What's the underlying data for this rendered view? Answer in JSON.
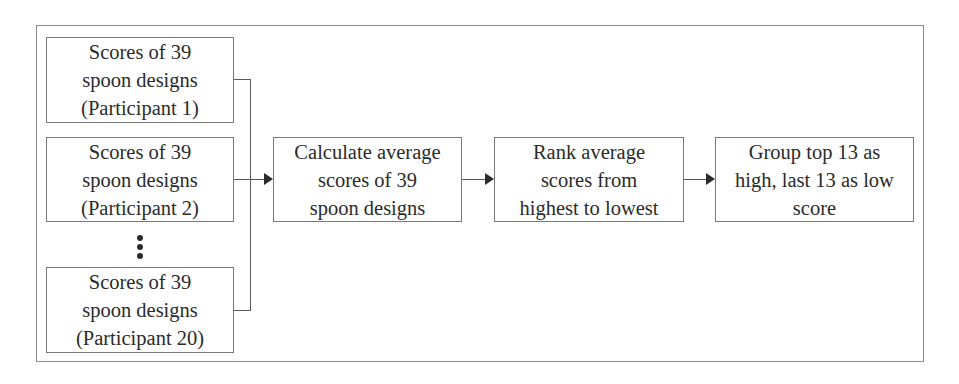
{
  "diagram": {
    "type": "flowchart",
    "inputs": [
      {
        "label": "Scores of 39\nspoon designs\n(Participant 1)"
      },
      {
        "label": "Scores of 39\nspoon designs\n(Participant 2)"
      },
      {
        "label": "Scores of 39\nspoon designs\n(Participant 20)"
      }
    ],
    "ellipsis": "⋮",
    "steps": [
      {
        "label": "Calculate average\nscores of 39\nspoon designs"
      },
      {
        "label": "Rank average\nscores from\nhighest to lowest"
      },
      {
        "label": "Group top 13 as\nhigh, last 13 as low\nscore"
      }
    ],
    "edges": [
      {
        "from": "inputs",
        "to": "steps.0"
      },
      {
        "from": "steps.0",
        "to": "steps.1"
      },
      {
        "from": "steps.1",
        "to": "steps.2"
      }
    ],
    "colors": {
      "border": "#7a7a7a",
      "line": "#5a5a5a",
      "text": "#2b2b2b",
      "background": "#ffffff"
    }
  }
}
